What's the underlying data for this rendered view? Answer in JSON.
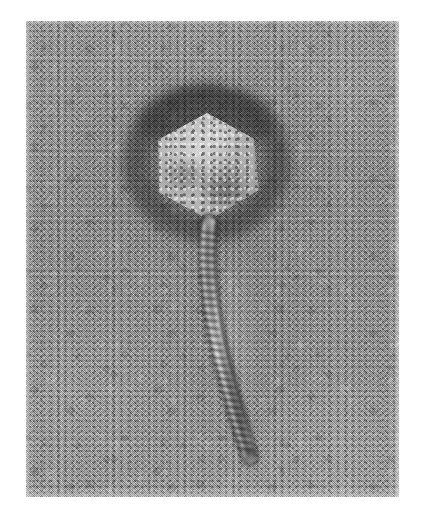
{
  "image": {
    "kind": "electron-micrograph",
    "technique": "negative-stain transmission electron microscopy",
    "subject": "bacteriophage virion",
    "caption": "",
    "alt_text": "Negative-stain transmission electron micrograph of a tailed bacteriophage showing a hexagonal icosahedral capsid head connected by a short neck to a long, slightly curved, transversely striated contractile tail ending in a baseplate.",
    "rendering": "halftone print, grayscale"
  },
  "canvas": {
    "width_px": 421,
    "height_px": 515,
    "margin_color": "#ffffff"
  },
  "plate": {
    "left_px": 26,
    "top_px": 21,
    "width_px": 373,
    "height_px": 476,
    "background_color": "#9d9d9d",
    "mean_gray": "#a2a2a2",
    "darkest_gray": "#2a2a2a",
    "lightest_gray": "#f0f0f0"
  },
  "features": [
    {
      "id": "capsid",
      "label": "Capsid head",
      "shape": "hexagonal outline (icosahedron in projection)",
      "center_px": [
        181,
        145
      ],
      "width_px": 104,
      "height_px": 107,
      "fill_color": "#b0b0b0"
    },
    {
      "id": "stain-halo",
      "label": "Negative stain halo",
      "shape": "dark diffuse ring surrounding head",
      "center_px": [
        181,
        142
      ],
      "width_px": 170,
      "height_px": 160,
      "fill_color": "#2f2f2f"
    },
    {
      "id": "neck",
      "label": "Neck / collar",
      "shape": "short narrow connector",
      "center_px": [
        184,
        204
      ],
      "width_px": 16,
      "height_px": 16,
      "fill_color": "#5a5a5a"
    },
    {
      "id": "tail",
      "label": "Contractile tail sheath",
      "shape": "long gently curved striated tube",
      "start_px": [
        183,
        204
      ],
      "end_px": [
        224,
        436
      ],
      "length_px": 236,
      "width_px": 13,
      "striation_count": 44,
      "fill_color": "#707070"
    },
    {
      "id": "baseplate",
      "label": "Baseplate / tail tip",
      "shape": "small dark terminal knob",
      "center_px": [
        224,
        432
      ],
      "width_px": 16,
      "height_px": 14,
      "fill_color": "#3d3d3d"
    }
  ],
  "colors": {
    "page": "#ffffff",
    "field": "#a2a2a2",
    "stain_dark": "#262626",
    "highlight": "#ededed",
    "capsid": "#b0b0b0",
    "tail": "#6e6e6e"
  }
}
